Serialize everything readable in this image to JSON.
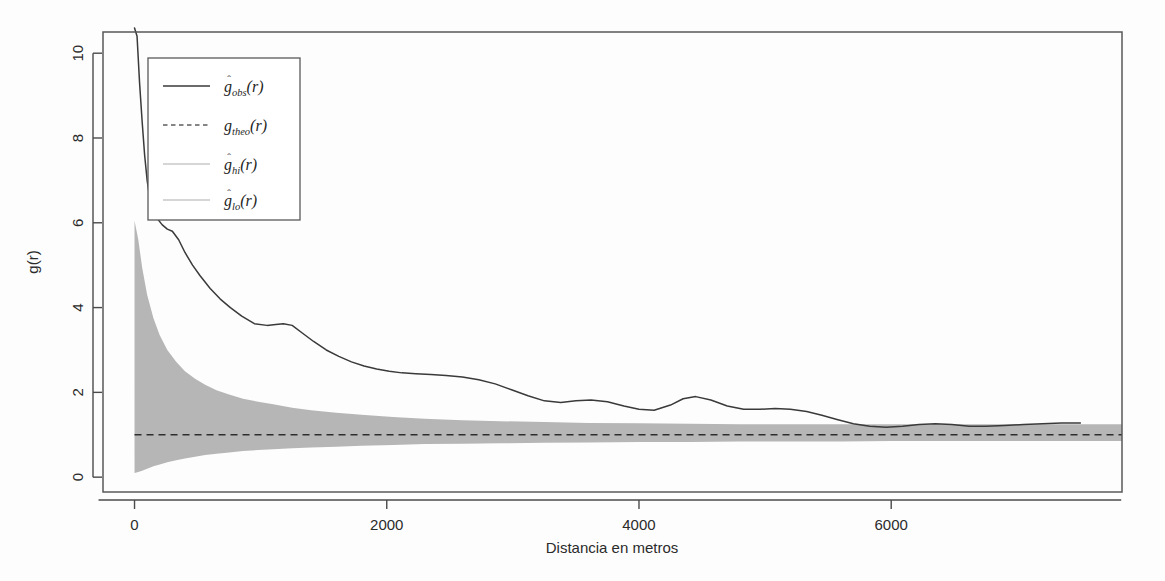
{
  "figure": {
    "name": "pair-correlation-function-plot",
    "background_color": "#fdfdfd",
    "plot_region_px": {
      "left": 103,
      "right": 1122,
      "top": 32,
      "bottom": 492
    }
  },
  "axes": {
    "x": {
      "label": "Distancia en metros",
      "ticks": [
        "0",
        "2000",
        "4000",
        "6000"
      ],
      "tick_values": [
        0,
        2000,
        4000,
        6000
      ],
      "range": [
        -250,
        7830
      ]
    },
    "y": {
      "label": "g(r)",
      "ticks": [
        "0",
        "2",
        "4",
        "6",
        "8",
        "10"
      ],
      "tick_values": [
        0,
        2,
        4,
        6,
        8,
        10
      ],
      "range": [
        -0.35,
        10.5
      ]
    }
  },
  "legend": {
    "name": "plot-legend",
    "position": "top-left-inside",
    "entries": [
      {
        "label": "g_obs(r)",
        "base": "g",
        "hat": true,
        "sub": "obs",
        "arg": "(r)",
        "key": "solid",
        "color": "#3a3a3a"
      },
      {
        "label": "g_theo(r)",
        "base": "g",
        "hat": false,
        "sub": "theo",
        "arg": "(r)",
        "key": "dashed",
        "color": "#5e5e5e"
      },
      {
        "label": "g_hi(r)",
        "base": "g",
        "hat": true,
        "sub": "hi",
        "arg": "(r)",
        "key": "faint",
        "color": "#c9c9c9"
      },
      {
        "label": "g_lo(r)",
        "base": "g",
        "hat": true,
        "sub": "lo",
        "arg": "(r)",
        "key": "faint",
        "color": "#c9c9c9"
      }
    ]
  },
  "chart_data": {
    "type": "line",
    "title": "",
    "subtitle": "",
    "xlabel": "Distancia en metros",
    "ylabel": "g(r)",
    "xlim": [
      -250,
      7830
    ],
    "ylim": [
      -0.35,
      10.5
    ],
    "grid": false,
    "legend_position": "top-left",
    "annotations": [],
    "series": [
      {
        "name": "g_obs(r)",
        "style": "solid",
        "color": "#3a3a3a",
        "x": [
          0,
          20,
          40,
          60,
          80,
          100,
          120,
          150,
          180,
          220,
          260,
          300,
          350,
          400,
          460,
          520,
          600,
          680,
          760,
          850,
          950,
          1050,
          1120,
          1180,
          1250,
          1330,
          1420,
          1520,
          1620,
          1720,
          1820,
          1920,
          2020,
          2120,
          2230,
          2350,
          2470,
          2600,
          2730,
          2860,
          3000,
          3120,
          3250,
          3380,
          3500,
          3620,
          3750,
          3880,
          4000,
          4120,
          4250,
          4350,
          4450,
          4570,
          4700,
          4830,
          4960,
          5080,
          5200,
          5330,
          5450,
          5570,
          5700,
          5830,
          5960,
          6090,
          6220,
          6350,
          6480,
          6620,
          6750,
          6900,
          7050,
          7200,
          7350,
          7500
        ],
        "y": [
          11.2,
          10.4,
          9.3,
          8.4,
          7.6,
          7.0,
          6.6,
          6.3,
          6.1,
          5.95,
          5.85,
          5.8,
          5.6,
          5.3,
          5.0,
          4.75,
          4.45,
          4.2,
          4.0,
          3.8,
          3.62,
          3.58,
          3.6,
          3.62,
          3.58,
          3.4,
          3.2,
          3.0,
          2.85,
          2.72,
          2.62,
          2.55,
          2.5,
          2.46,
          2.44,
          2.42,
          2.4,
          2.36,
          2.3,
          2.2,
          2.05,
          1.92,
          1.8,
          1.76,
          1.8,
          1.82,
          1.78,
          1.68,
          1.6,
          1.58,
          1.7,
          1.85,
          1.9,
          1.82,
          1.68,
          1.6,
          1.6,
          1.62,
          1.6,
          1.55,
          1.46,
          1.36,
          1.26,
          1.2,
          1.18,
          1.2,
          1.24,
          1.26,
          1.24,
          1.2,
          1.2,
          1.22,
          1.24,
          1.26,
          1.28,
          1.28
        ]
      },
      {
        "name": "g_theo(r)",
        "style": "dashed",
        "color": "#2e2e2e",
        "constant": 1.0,
        "x": [
          0,
          7830
        ],
        "y": [
          1.0,
          1.0
        ]
      },
      {
        "name": "g_hi(r)",
        "style": "envelope-upper",
        "color": "#b6b6b6",
        "x": [
          0,
          30,
          60,
          100,
          150,
          200,
          260,
          330,
          400,
          480,
          560,
          650,
          750,
          860,
          980,
          1100,
          1250,
          1400,
          1600,
          1800,
          2050,
          2300,
          2600,
          2900,
          3250,
          3600,
          4000,
          4400,
          4800,
          5200,
          5600,
          6000,
          6400,
          6800,
          7200,
          7600,
          7830
        ],
        "y": [
          6.05,
          5.6,
          4.95,
          4.3,
          3.75,
          3.35,
          3.0,
          2.72,
          2.5,
          2.32,
          2.18,
          2.05,
          1.95,
          1.85,
          1.78,
          1.72,
          1.64,
          1.58,
          1.52,
          1.47,
          1.42,
          1.38,
          1.34,
          1.32,
          1.3,
          1.28,
          1.27,
          1.26,
          1.25,
          1.25,
          1.25,
          1.25,
          1.25,
          1.25,
          1.25,
          1.25,
          1.25
        ]
      },
      {
        "name": "g_lo(r)",
        "style": "envelope-lower",
        "color": "#b6b6b6",
        "x": [
          0,
          30,
          60,
          100,
          150,
          200,
          260,
          330,
          400,
          480,
          560,
          650,
          750,
          860,
          980,
          1100,
          1250,
          1400,
          1600,
          1800,
          2050,
          2300,
          2600,
          2900,
          3250,
          3600,
          4000,
          4400,
          4800,
          5200,
          5600,
          6000,
          6400,
          6800,
          7200,
          7600,
          7830
        ],
        "y": [
          0.1,
          0.12,
          0.15,
          0.2,
          0.26,
          0.3,
          0.35,
          0.4,
          0.44,
          0.48,
          0.52,
          0.55,
          0.58,
          0.62,
          0.64,
          0.66,
          0.68,
          0.7,
          0.72,
          0.74,
          0.76,
          0.78,
          0.79,
          0.8,
          0.81,
          0.82,
          0.83,
          0.83,
          0.84,
          0.84,
          0.84,
          0.85,
          0.85,
          0.85,
          0.85,
          0.85,
          0.85
        ]
      }
    ]
  }
}
